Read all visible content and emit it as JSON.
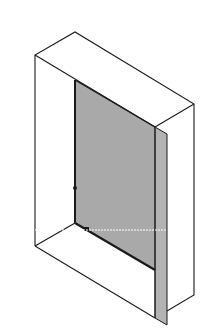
{
  "diagram": {
    "type": "isometric-box",
    "colors": {
      "background": "#ffffff",
      "outline": "#1a1a1a",
      "panel_fill": "#a9a9a9",
      "panel_edge_fill": "#b3b3b3",
      "guide_line": "#ffffff"
    },
    "points": {
      "top_apex": [
        75,
        32
      ],
      "top_left": [
        35,
        55
      ],
      "top_right": [
        194,
        104
      ],
      "front_top_right": [
        155,
        127
      ],
      "inner_top": [
        75,
        80
      ],
      "bottom_left": [
        35,
        246
      ],
      "inner_bottom": [
        75,
        223
      ],
      "bottom_right": [
        194,
        295
      ],
      "front_bottom_right": [
        155,
        318
      ],
      "panel_bottom_inner": [
        155,
        270
      ],
      "marker": [
        75,
        188
      ]
    }
  }
}
